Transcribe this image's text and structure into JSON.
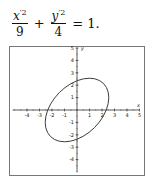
{
  "equation": {
    "term1": {
      "numerator_var": "x",
      "prime_power": "′2",
      "denominator": "9"
    },
    "plus": "+",
    "term2": {
      "numerator_var": "y",
      "prime_power": "′2",
      "denominator": "4"
    },
    "equals": "=",
    "rhs": "1."
  },
  "chart_data": {
    "type": "line",
    "title": "",
    "xlabel": "x",
    "ylabel": "y",
    "xlim": [
      -5,
      5
    ],
    "ylim": [
      -5,
      5
    ],
    "x_ticks": [
      -4,
      -3,
      -2,
      -1,
      1,
      2,
      3,
      4,
      5
    ],
    "y_ticks": [
      -4,
      -3,
      -2,
      -1,
      1,
      2,
      3,
      4,
      5
    ],
    "grid": false,
    "series": [
      {
        "name": "rotated ellipse x'^2/9 + y'^2/4 = 1 (rotated 45°)",
        "shape": "ellipse",
        "center": [
          0,
          0
        ],
        "semi_major": 3,
        "semi_minor": 2,
        "rotation_deg": 45
      }
    ]
  }
}
